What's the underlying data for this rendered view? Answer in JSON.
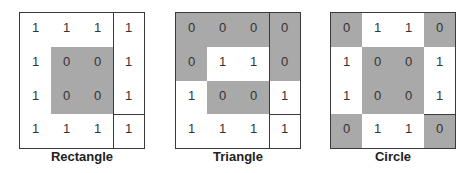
{
  "panels": [
    {
      "label": "Rectangle",
      "grid": [
        [
          "1",
          "1",
          "1",
          "1"
        ],
        [
          "1",
          "0",
          "0",
          "1"
        ],
        [
          "1",
          "0",
          "0",
          "1"
        ],
        [
          "1",
          "1",
          "1",
          "1"
        ]
      ]
    },
    {
      "label": "Triangle",
      "grid": [
        [
          "0",
          "0",
          "0",
          "0"
        ],
        [
          "0",
          "1",
          "1",
          "0"
        ],
        [
          "1",
          "0",
          "0",
          "1"
        ],
        [
          "1",
          "1",
          "1",
          "1"
        ]
      ]
    },
    {
      "label": "Circle",
      "grid": [
        [
          "0",
          "1",
          "1",
          "0"
        ],
        [
          "1",
          "0",
          "0",
          "1"
        ],
        [
          "1",
          "0",
          "0",
          "1"
        ],
        [
          "0",
          "1",
          "1",
          "0"
        ]
      ]
    }
  ],
  "colors": {
    "zero_fill": "#a9a9a9",
    "one_fill": "#ffffff",
    "border": "#3a3a3a"
  }
}
